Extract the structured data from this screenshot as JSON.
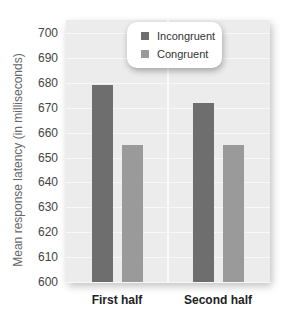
{
  "chart_data": {
    "type": "bar",
    "title": "",
    "xlabel": "",
    "ylabel": "Mean response latency (in milliseconds)",
    "categories": [
      "First half",
      "Second half"
    ],
    "series": [
      {
        "name": "Incongruent",
        "color": "#6e6e6e",
        "values": [
          679,
          672
        ]
      },
      {
        "name": "Congruent",
        "color": "#9a9a9a",
        "values": [
          655,
          655
        ]
      }
    ],
    "ylim": [
      600,
      700
    ],
    "yticks": [
      600,
      610,
      620,
      630,
      640,
      650,
      660,
      670,
      680,
      690,
      700
    ],
    "grid": true,
    "legend_position": "top-center"
  },
  "legend": {
    "items": [
      {
        "label": "Incongruent",
        "color": "#6e6e6e"
      },
      {
        "label": "Congruent",
        "color": "#9a9a9a"
      }
    ]
  },
  "axis": {
    "ylabel": "Mean response latency (in milliseconds)",
    "xlabels": [
      "First half",
      "Second half"
    ]
  }
}
